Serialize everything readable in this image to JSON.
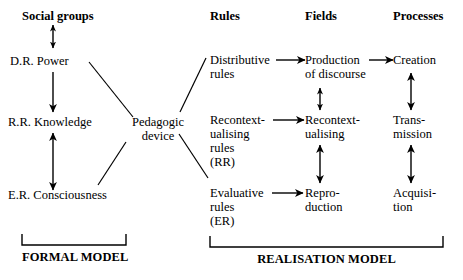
{
  "figure": {
    "type": "diagram",
    "background_color": "#ffffff",
    "ink_color": "#000000"
  },
  "columns": {
    "headers": [
      {
        "id": "social-groups",
        "label": "Social groups"
      },
      {
        "id": "rules",
        "label": "Rules"
      },
      {
        "id": "fields",
        "label": "Fields"
      },
      {
        "id": "processes",
        "label": "Processes"
      }
    ]
  },
  "left_column": {
    "nodes": [
      {
        "id": "dr-power",
        "label": "D.R. Power"
      },
      {
        "id": "rr-knowledge",
        "label": "R.R. Knowledge"
      },
      {
        "id": "er-consciousness",
        "label": "E.R. Consciousness"
      }
    ]
  },
  "center": {
    "node": {
      "id": "pedagogic-device",
      "line1": "Pedagogic",
      "line2": "device"
    }
  },
  "rules_column": {
    "nodes": [
      {
        "id": "distributive-rules",
        "line1": "Distributive",
        "line2": "rules",
        "line3": ""
      },
      {
        "id": "recontextualising-rules",
        "line1": "Recontext-",
        "line2": "ualising",
        "line3": "rules",
        "line4": "(RR)"
      },
      {
        "id": "evaluative-rules",
        "line1": "Evaluative",
        "line2": "rules",
        "line3": "(ER)"
      }
    ]
  },
  "fields_column": {
    "nodes": [
      {
        "id": "production-of-discourse",
        "line1": "Production",
        "line2": "of discourse"
      },
      {
        "id": "recontextualising-field",
        "line1": "Recontext-",
        "line2": "ualising"
      },
      {
        "id": "reproduction",
        "line1": "Repro-",
        "line2": "duction"
      }
    ]
  },
  "processes_column": {
    "nodes": [
      {
        "id": "creation",
        "line1": "Creation",
        "line2": ""
      },
      {
        "id": "transmission",
        "line1": "Trans-",
        "line2": "mission"
      },
      {
        "id": "acquisition",
        "line1": "Acquisi-",
        "line2": "tion"
      }
    ]
  },
  "brackets": [
    {
      "id": "formal-model",
      "label": "FORMAL MODEL"
    },
    {
      "id": "realisation-model",
      "label": "REALISATION MODEL"
    }
  ],
  "connections": {
    "vertical_left": [
      {
        "from": "social-groups",
        "to": "dr-power",
        "arrow": "double"
      },
      {
        "from": "dr-power",
        "to": "rr-knowledge",
        "arrow": "down"
      },
      {
        "from": "rr-knowledge",
        "to": "er-consciousness",
        "arrow": "double"
      }
    ],
    "pedagogic_device_links": [
      {
        "from": "dr-power",
        "to": "pedagogic-device",
        "arrow": "none"
      },
      {
        "from": "er-consciousness",
        "to": "pedagogic-device",
        "arrow": "none"
      },
      {
        "from": "pedagogic-device",
        "to": "distributive-rules",
        "arrow": "none"
      },
      {
        "from": "pedagogic-device",
        "to": "recontextualising-rules",
        "arrow": "none"
      }
    ],
    "horizontal": [
      {
        "from": "distributive-rules",
        "to": "production-of-discourse",
        "arrow": "right"
      },
      {
        "from": "production-of-discourse",
        "to": "creation",
        "arrow": "right"
      },
      {
        "from": "recontextualising-rules",
        "to": "recontextualising-field",
        "arrow": "right"
      },
      {
        "from": "evaluative-rules",
        "to": "reproduction",
        "arrow": "right"
      }
    ],
    "vertical_right": [
      {
        "from": "production-of-discourse",
        "to": "recontextualising-field",
        "arrow": "double"
      },
      {
        "from": "recontextualising-field",
        "to": "reproduction",
        "arrow": "double"
      },
      {
        "from": "creation",
        "to": "transmission",
        "arrow": "double"
      },
      {
        "from": "transmission",
        "to": "acquisition",
        "arrow": "double"
      }
    ]
  }
}
